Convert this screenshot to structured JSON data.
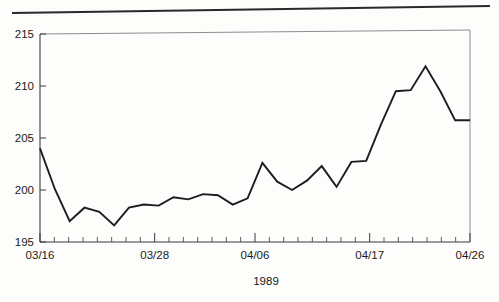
{
  "chart_data": {
    "type": "line",
    "title": "",
    "subtitle": "",
    "xlabel": "1989",
    "ylabel": "",
    "ylim": [
      195,
      215
    ],
    "ytick_values": [
      195,
      200,
      205,
      210,
      215
    ],
    "ytick_labels": [
      "195",
      "200",
      "205",
      "210",
      "215"
    ],
    "xtick_labels": [
      "03/16",
      "03/28",
      "04/06",
      "04/17",
      "04/26"
    ],
    "xtick_label_indices": [
      0,
      8,
      15,
      23,
      30
    ],
    "grid": false,
    "legend": null,
    "n_minor_ticks": 31,
    "line_color": "#1d1d1d",
    "axis_color": "#3b3b3b",
    "x": [
      "03/16",
      "03/17",
      "03/20",
      "03/21",
      "03/22",
      "03/23",
      "03/24",
      "03/27",
      "03/28",
      "03/29",
      "03/30",
      "03/31",
      "04/03",
      "04/04",
      "04/05",
      "04/06",
      "04/07",
      "04/10",
      "04/11",
      "04/12",
      "04/13",
      "04/14",
      "04/17",
      "04/18",
      "04/19",
      "04/20",
      "04/21",
      "04/24",
      "04/25",
      "04/26"
    ],
    "values": [
      204.0,
      200.1,
      197.0,
      198.3,
      197.9,
      196.6,
      198.3,
      198.6,
      198.5,
      199.3,
      199.1,
      199.6,
      199.5,
      198.6,
      199.2,
      202.6,
      200.8,
      200.0,
      200.9,
      202.3,
      200.3,
      202.7,
      202.8,
      206.3,
      209.5,
      209.6,
      211.9,
      209.5,
      206.7,
      206.7
    ],
    "series": [
      {
        "name": "price",
        "values": [
          204.0,
          200.1,
          197.0,
          198.3,
          197.9,
          196.6,
          198.3,
          198.6,
          198.5,
          199.3,
          199.1,
          199.6,
          199.5,
          198.6,
          199.2,
          202.6,
          200.8,
          200.0,
          200.9,
          202.3,
          200.3,
          202.7,
          202.8,
          206.3,
          209.5,
          209.6,
          211.9,
          209.5,
          206.7,
          206.7
        ]
      }
    ]
  },
  "figure": {
    "top_rule_present": true
  }
}
